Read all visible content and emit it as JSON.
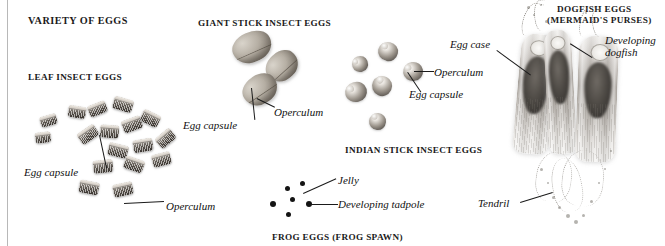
{
  "page": {
    "title": "VARIETY OF EGGS",
    "background_color": "#ffffff",
    "rule_color": "#b8b8b8"
  },
  "sections": [
    {
      "id": "leaf-insect-eggs",
      "heading": "LEAF INSECT EGGS",
      "callouts": [
        {
          "id": "egg-capsule",
          "text": "Egg capsule"
        },
        {
          "id": "operculum",
          "text": "Operculum"
        }
      ]
    },
    {
      "id": "giant-stick-insect-eggs",
      "heading": "GIANT STICK INSECT EGGS",
      "callouts": [
        {
          "id": "egg-capsule",
          "text": "Egg capsule"
        },
        {
          "id": "operculum",
          "text": "Operculum"
        }
      ]
    },
    {
      "id": "indian-stick-insect-eggs",
      "heading": "INDIAN STICK INSECT EGGS",
      "callouts": [
        {
          "id": "operculum",
          "text": "Operculum"
        },
        {
          "id": "egg-capsule",
          "text": "Egg capsule"
        }
      ]
    },
    {
      "id": "frog-eggs",
      "heading": "FROG EGGS (FROG SPAWN)",
      "callouts": [
        {
          "id": "jelly",
          "text": "Jelly"
        },
        {
          "id": "developing-tadpole",
          "text": "Developing tadpole"
        }
      ]
    },
    {
      "id": "dogfish-eggs",
      "heading_line1": "DOGFISH EGGS",
      "heading_line2": "(MERMAID'S PURSES)",
      "callouts": [
        {
          "id": "egg-case",
          "text": "Egg case"
        },
        {
          "id": "developing-dogfish-line1",
          "text": "Developing"
        },
        {
          "id": "developing-dogfish-line2",
          "text": "dogfish"
        },
        {
          "id": "tendril",
          "text": "Tendril"
        }
      ]
    }
  ]
}
